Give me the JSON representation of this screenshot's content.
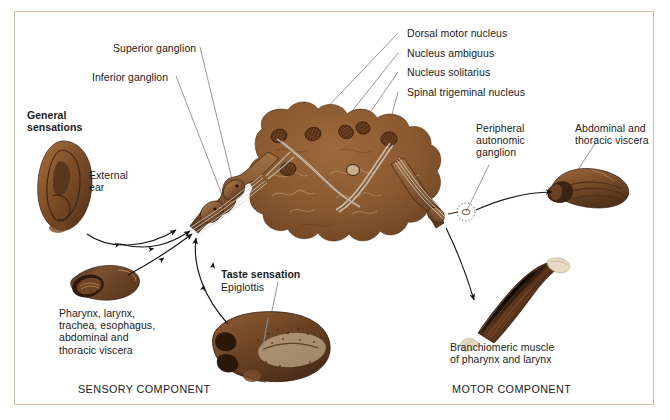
{
  "figure": {
    "border_color": "#cbbfa8",
    "background_color": "#ffffff",
    "anatomy_fill": "#8a5a32",
    "anatomy_dark": "#4a2a16",
    "leader_line_color": "#8c8c8c",
    "arrow_color": "#1a1a1a"
  },
  "labels": {
    "superior_ganglion": "Superior ganglion",
    "inferior_ganglion": "Inferior ganglion",
    "general_sensations": "General\nsensations",
    "external_ear": "External\near",
    "dorsal_motor_nucleus": "Dorsal motor nucleus",
    "nucleus_ambiguus": "Nucleus ambiguus",
    "nucleus_solitarius": "Nucleus solitarius",
    "spinal_trigeminal_nucleus": "Spinal trigeminal nucleus",
    "peripheral_autonomic_ganglion": "Peripheral\nautonomic\nganglion",
    "abdominal_thoracic_viscera": "Abdominal and\nthoracic viscera",
    "pharynx_list": "Pharynx, larynx,\ntrachea, esophagus,\nabdominal and\nthoracic viscera",
    "taste_sensation": "Taste sensation",
    "epiglottis": "Epiglottis",
    "branchiomeric_muscle": "Branchiomeric muscle\nof pharynx and larynx",
    "sensory_component": "SENSORY COMPONENT",
    "motor_component": "MOTOR COMPONENT"
  },
  "structures": [
    {
      "name": "external-ear",
      "label": "External ear"
    },
    {
      "name": "brainstem-cross-section",
      "label": "Brainstem cross section"
    },
    {
      "name": "vagus-nerve-trunk",
      "label": "Vagus nerve trunk with ganglia"
    },
    {
      "name": "trachea-esophagus",
      "label": "Pharynx, larynx, trachea, esophagus"
    },
    {
      "name": "tongue-epiglottis",
      "label": "Tongue and epiglottis"
    },
    {
      "name": "visceral-organ",
      "label": "Abdominal and thoracic viscera"
    },
    {
      "name": "skeletal-muscle",
      "label": "Branchiomeric muscle"
    },
    {
      "name": "autonomic-ganglion",
      "label": "Peripheral autonomic ganglion"
    }
  ]
}
